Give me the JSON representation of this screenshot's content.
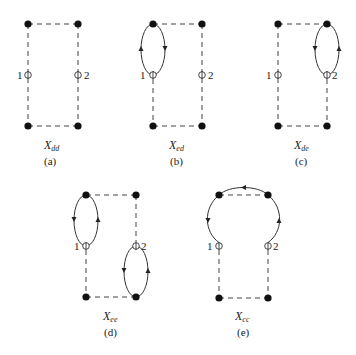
{
  "diagrams": [
    {
      "id": "a",
      "name_base": "X",
      "name_sub": "dd",
      "caption": "(a)",
      "node_labels": [
        "1",
        "2"
      ],
      "loops": "none"
    },
    {
      "id": "b",
      "name_base": "X",
      "name_sub": "ed",
      "caption": "(b)",
      "node_labels": [
        "1",
        "2"
      ],
      "loops": "loop between top-left vertex and node 1"
    },
    {
      "id": "c",
      "name_base": "X",
      "name_sub": "de",
      "caption": "(c)",
      "node_labels": [
        "1",
        "2"
      ],
      "loops": "loop between top-right vertex and node 2"
    },
    {
      "id": "d",
      "name_base": "X",
      "name_sub": "ee",
      "caption": "(d)",
      "node_labels": [
        "1",
        "2"
      ],
      "loops": "loop between top-left vertex and node 1; loop between node 2 and bottom-right vertex"
    },
    {
      "id": "e",
      "name_base": "X",
      "name_sub": "cc",
      "caption": "(e)",
      "node_labels": [
        "1",
        "2"
      ],
      "loops": "arc from node 2 over both top vertices to node 1"
    }
  ],
  "colors": {
    "ink": "#222222",
    "background": "#ffffff"
  }
}
